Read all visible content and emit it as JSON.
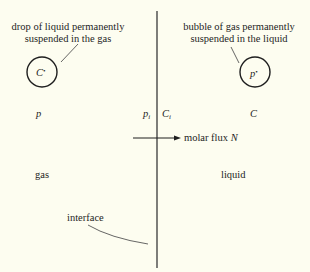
{
  "diagram": {
    "regions": {
      "left": "gas",
      "right": "liquid"
    },
    "annotations": {
      "drop": {
        "line1": "drop of liquid permanently",
        "line2": "suspended in the gas",
        "symbol": "C",
        "symbol_sup": "•"
      },
      "bubble": {
        "line1": "bubble of gas permanently",
        "line2": "suspended in the liquid",
        "symbol": "p",
        "symbol_sup": "•"
      },
      "interface": "interface"
    },
    "variables": {
      "bulk_gas": "p",
      "interface_gas": "p",
      "interface_gas_sub": "i",
      "interface_liquid": "C",
      "interface_liquid_sub": "i",
      "bulk_liquid": "C"
    },
    "flux": {
      "label": "molar flux",
      "symbol": "N",
      "direction": "gas-to-liquid"
    },
    "colors": {
      "background": "#fdfdf0",
      "ink": "#1e1e1e"
    }
  }
}
